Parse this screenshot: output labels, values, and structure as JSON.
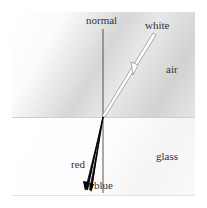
{
  "diagram": {
    "labels": {
      "normal": "normal",
      "incident": "white",
      "upper_medium": "air",
      "lower_medium": "glass",
      "refracted_red": "red",
      "refracted_blue": "blue"
    },
    "colors": {
      "normal_line": "#444444",
      "incident_ray_outline": "#888888",
      "refracted_rays": "#111111",
      "boundary": "#cfcfcf"
    },
    "geometry": {
      "normal_x": 103,
      "boundary_y": 117,
      "incidence_point": [
        103,
        117
      ]
    }
  }
}
